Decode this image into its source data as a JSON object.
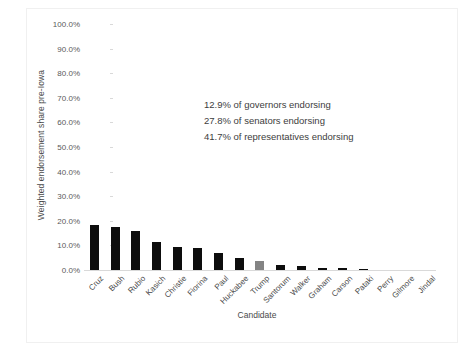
{
  "chart_data": {
    "type": "bar",
    "title": "",
    "xlabel": "Candidate",
    "ylabel": "Weighted endorsement share pre-Iowa",
    "ylim": [
      0,
      100
    ],
    "ytick_step": 10,
    "ytick_labels": [
      "100.0%",
      "90.0%",
      "80.0%",
      "70.0%",
      "60.0%",
      "50.0%",
      "40.0%",
      "30.0%",
      "20.0%",
      "10.0%",
      "0.0%"
    ],
    "grid": false,
    "legend": "none",
    "bar_color": "#0d0d0d",
    "highlight_color": "#848484",
    "highlight_category": "Trump",
    "categories": [
      "Cruz",
      "Bush",
      "Rubio",
      "Kasich",
      "Christie",
      "Fiorina",
      "Paul",
      "Huckabee",
      "Trump",
      "Santorum",
      "Walker",
      "Graham",
      "Carson",
      "Pataki",
      "Perry",
      "Gilmore",
      "Jindal"
    ],
    "values": [
      18.5,
      17.5,
      16.0,
      11.5,
      9.5,
      9.0,
      7.0,
      5.0,
      3.5,
      2.0,
      1.8,
      1.0,
      0.8,
      0.6,
      0.0,
      0.0,
      0.0
    ],
    "annotations": [
      "12.9% of governors endorsing",
      "27.8% of senators endorsing",
      "41.7% of representatives endorsing"
    ]
  }
}
